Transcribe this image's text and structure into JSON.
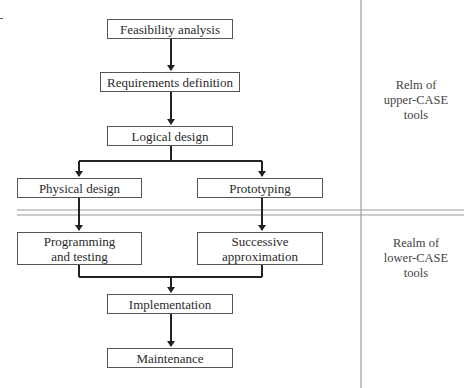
{
  "diagram": {
    "type": "flowchart",
    "nodes": {
      "feasibility": "Feasibility analysis",
      "requirements": "Requirements definition",
      "logical": "Logical design",
      "physical": "Physical design",
      "prototyping": "Prototyping",
      "programming_line1": "Programming",
      "programming_line2": "and testing",
      "successive_line1": "Successive",
      "successive_line2": "approximation",
      "implementation": "Implementation",
      "maintenance": "Maintenance"
    },
    "regions": {
      "upper_line1": "Relm of",
      "upper_line2": "upper-CASE",
      "upper_line3": "tools",
      "lower_line1": "Realm of",
      "lower_line2": "lower-CASE",
      "lower_line3": "tools"
    },
    "edges": [
      [
        "Feasibility analysis",
        "Requirements definition"
      ],
      [
        "Requirements definition",
        "Logical design"
      ],
      [
        "Logical design",
        "Physical design"
      ],
      [
        "Logical design",
        "Prototyping"
      ],
      [
        "Physical design",
        "Programming and testing"
      ],
      [
        "Prototyping",
        "Successive approximation"
      ],
      [
        "Programming and testing",
        "Implementation"
      ],
      [
        "Successive approximation",
        "Implementation"
      ],
      [
        "Implementation",
        "Maintenance"
      ]
    ]
  }
}
